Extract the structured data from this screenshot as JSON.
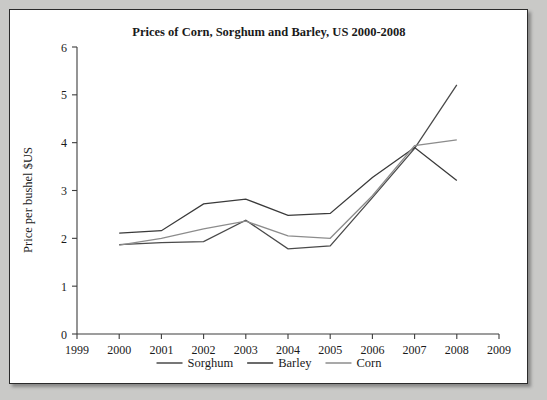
{
  "chart_data": {
    "type": "line",
    "title": "Prices of Corn, Sorghum and Barley, US 2000-2008",
    "xlabel": "",
    "ylabel": "Price per bushel $US",
    "x": [
      2000,
      2001,
      2002,
      2003,
      2004,
      2005,
      2006,
      2007,
      2008
    ],
    "xlim": [
      1999,
      2009
    ],
    "ylim": [
      0,
      6
    ],
    "xticks": [
      1999,
      2000,
      2001,
      2002,
      2003,
      2004,
      2005,
      2006,
      2007,
      2008,
      2009
    ],
    "yticks": [
      0,
      1,
      2,
      3,
      4,
      5,
      6
    ],
    "grid": false,
    "legend_position": "bottom",
    "series": [
      {
        "name": "Sorghum",
        "color": "#4a4a4a",
        "values": [
          1.87,
          1.91,
          1.93,
          2.38,
          1.78,
          1.84,
          2.85,
          3.88,
          5.21
        ]
      },
      {
        "name": "Barley",
        "color": "#3a3a3a",
        "values": [
          2.11,
          2.16,
          2.72,
          2.82,
          2.48,
          2.52,
          3.27,
          3.9,
          3.21
        ]
      },
      {
        "name": "Corn",
        "color": "#8c8c8c",
        "values": [
          1.86,
          2.0,
          2.2,
          2.36,
          2.05,
          2.0,
          2.89,
          3.94,
          4.06
        ]
      }
    ]
  },
  "legend": {
    "entries": [
      {
        "label": "Sorghum"
      },
      {
        "label": "Barley"
      },
      {
        "label": "Corn"
      }
    ]
  }
}
